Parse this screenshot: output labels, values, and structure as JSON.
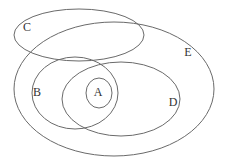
{
  "diagram": {
    "type": "venn-euler",
    "width": 226,
    "height": 168,
    "line_color": "#6a6a6a",
    "label_color": "#333333",
    "background": "#ffffff",
    "sets": [
      {
        "id": "E",
        "label": "E",
        "ellipse": {
          "cx": 114,
          "cy": 89,
          "rx": 100,
          "ry": 67
        },
        "label_pos": {
          "x": 188,
          "y": 53
        }
      },
      {
        "id": "C",
        "label": "C",
        "ellipse": {
          "cx": 79,
          "cy": 35,
          "rx": 65,
          "ry": 26
        },
        "label_pos": {
          "x": 27,
          "y": 28
        }
      },
      {
        "id": "B",
        "label": "B",
        "ellipse": {
          "cx": 75,
          "cy": 93,
          "rx": 43,
          "ry": 36
        },
        "label_pos": {
          "x": 37,
          "y": 93
        }
      },
      {
        "id": "D",
        "label": "D",
        "ellipse": {
          "cx": 121,
          "cy": 99,
          "rx": 59,
          "ry": 37
        },
        "label_pos": {
          "x": 173,
          "y": 103
        }
      },
      {
        "id": "A",
        "label": "A",
        "ellipse": {
          "cx": 99,
          "cy": 93,
          "rx": 13,
          "ry": 15
        },
        "label_pos": {
          "x": 98,
          "y": 93
        }
      }
    ]
  }
}
